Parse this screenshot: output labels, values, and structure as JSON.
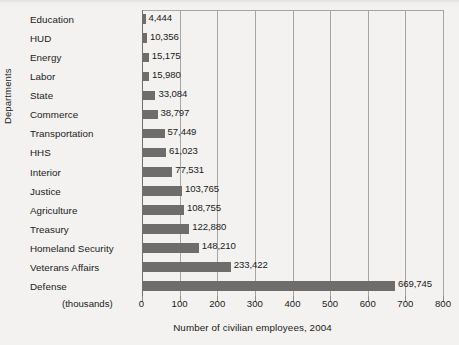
{
  "chart_data": {
    "type": "bar",
    "orientation": "horizontal",
    "title": "",
    "xlabel": "Number of civilian employees, 2004",
    "ylabel": "Departments",
    "units_note": "(thousands)",
    "categories": [
      "Education",
      "HUD",
      "Energy",
      "Labor",
      "State",
      "Commerce",
      "Transportation",
      "HHS",
      "Interior",
      "Justice",
      "Agriculture",
      "Treasury",
      "Homeland Security",
      "Veterans Affairs",
      "Defense"
    ],
    "values": [
      4444,
      10356,
      15175,
      15980,
      33084,
      38797,
      57449,
      61023,
      77531,
      103765,
      108755,
      122880,
      148210,
      233422,
      669745
    ],
    "value_labels": [
      "4,444",
      "10,356",
      "15,175",
      "15,980",
      "33,084",
      "38,797",
      "57,449",
      "61,023",
      "77,531",
      "103,765",
      "108,755",
      "122,880",
      "148,210",
      "233,422",
      "669,745"
    ],
    "xlim": [
      0,
      800000
    ],
    "xticks": [
      0,
      100,
      200,
      300,
      400,
      500,
      600,
      700,
      800
    ],
    "xtick_labels": [
      "0",
      "100",
      "200",
      "300",
      "400",
      "500",
      "600",
      "700",
      "800"
    ],
    "grid": true,
    "legend": null,
    "bar_color": "#6e6d6b",
    "background_color": "#f3f2f0",
    "gridline_color": "#a7a6a4"
  }
}
